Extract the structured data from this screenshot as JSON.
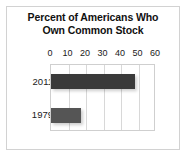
{
  "figure": {
    "title_lines": [
      "Percent of Americans Who",
      "Own Common Stock"
    ],
    "frame_color": "#d2d2d2",
    "background": "#ffffff"
  },
  "chart_data": {
    "type": "bar",
    "orientation": "horizontal",
    "categories": [
      "2011",
      "1979"
    ],
    "values": [
      48,
      17
    ],
    "series": [
      {
        "name": "Percent owning common stock",
        "values": [
          48,
          17
        ]
      }
    ],
    "xlabel": "",
    "ylabel": "",
    "xlim": [
      0,
      60
    ],
    "xticks": [
      0,
      10,
      20,
      30,
      40,
      50,
      60
    ],
    "xtick_labels": [
      "0",
      "10",
      "20",
      "30",
      "40",
      "50",
      "60"
    ],
    "grid": true,
    "grid_axis": "x",
    "legend": false,
    "bar_colors": [
      "#3a3a3a",
      "#555555"
    ],
    "gridline_color": "#d8d8d8",
    "plot_border_color": "#cfcfcf"
  }
}
